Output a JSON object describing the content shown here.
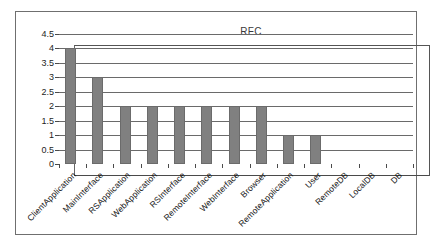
{
  "chart_data": {
    "type": "bar",
    "title": "RFC",
    "xlabel": "",
    "ylabel": "",
    "ylim": [
      0,
      4.5
    ],
    "grid": true,
    "legend": "none",
    "categories": [
      "ClientApplication",
      "MainInterface",
      "RSApplication",
      "WebApplication",
      "RSInterface",
      "RemoteInterface",
      "WebInterface",
      "Browser",
      "RemoteApplication",
      "User",
      "RemoteDB",
      "LocalDB",
      "DB"
    ],
    "values": [
      4,
      3,
      2,
      2,
      2,
      2,
      2,
      2,
      1,
      1,
      0,
      0,
      0
    ],
    "yticks": [
      "0",
      "0.5",
      "1",
      "1.5",
      "2",
      "2.5",
      "3",
      "3.5",
      "4",
      "4.5"
    ],
    "ytick_values": [
      0,
      0.5,
      1,
      1.5,
      2,
      2.5,
      3,
      3.5,
      4,
      4.5
    ],
    "bar_color": "#808080",
    "bar_border_color": "#6b6b6b",
    "gridline_color": "#6a6a6a",
    "axis_color": "#4a4a4a",
    "frame_color": "#6f6f6f",
    "background": "#ffffff"
  }
}
